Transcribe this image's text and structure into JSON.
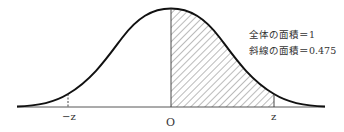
{
  "diagram": {
    "type": "normal-distribution-curve",
    "annotations": {
      "total_area": "全体の面積＝1",
      "shaded_area": "斜線の面積＝0.475"
    },
    "axis_labels": {
      "neg_z": "−z",
      "origin": "O",
      "pos_z": "z"
    },
    "shaded_region": {
      "from": "O",
      "to": "z",
      "area": 0.475
    },
    "total_area": 1,
    "colors": {
      "curve": "#111111",
      "hatch": "#555555",
      "axis": "#444444"
    }
  }
}
